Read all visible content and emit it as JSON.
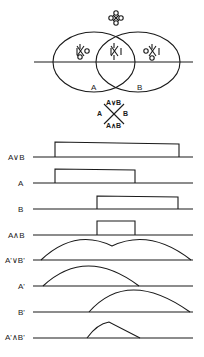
{
  "venn": {
    "top_symbol": "◊ (O/X cluster)",
    "region_left_symbol": "I X O",
    "region_center_symbol": "I X I",
    "region_right_symbol": "O X I",
    "label_a": "A",
    "label_b": "B"
  },
  "cross_diagram": {
    "top": "A∨B",
    "left": "A",
    "right": "B",
    "bottom": "A∧B"
  },
  "rows": [
    {
      "label": "A∨B",
      "shape": "rect",
      "start": 55,
      "end": 179
    },
    {
      "label": "A",
      "shape": "rect",
      "start": 55,
      "end": 135
    },
    {
      "label": "B",
      "shape": "rect",
      "start": 97,
      "end": 178
    },
    {
      "label": "A∧B",
      "shape": "rect",
      "start": 97,
      "end": 135
    },
    {
      "label": "A'∨B'",
      "shape": "arc-union",
      "start": 41,
      "end": 191
    },
    {
      "label": "A'",
      "shape": "arc",
      "start": 43,
      "end": 139
    },
    {
      "label": "B'",
      "shape": "arc",
      "start": 89,
      "end": 190
    },
    {
      "label": "A'∧B'",
      "shape": "arc-intersection",
      "start": 87,
      "end": 140
    }
  ]
}
